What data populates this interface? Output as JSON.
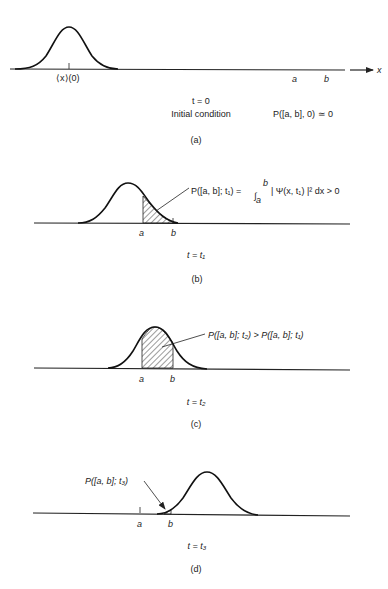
{
  "figure": {
    "panels": [
      {
        "id": "a",
        "caption": "(a)",
        "time_label": "t = 0",
        "subtitle": "Initial condition",
        "mean_label": "⟨x⟩(0)",
        "a_label": "a",
        "b_label": "b",
        "axis_label": "x",
        "probability_label": "P([a, b], 0) ≃ 0"
      },
      {
        "id": "b",
        "caption": "(b)",
        "time_label": "t = t₁",
        "a_label": "a",
        "b_label": "b",
        "probability_label": "P([a, b]; t₁) = ∫ₐᵇ |Ψ(x, t₁)|² dx > 0",
        "prob_lhs": "P([a, b]; t₁) =",
        "integral_sign": "∫",
        "int_upper": "b",
        "int_lower": "a",
        "integrand": "| Ψ(x, t₁) |² dx > 0"
      },
      {
        "id": "c",
        "caption": "(c)",
        "time_label": "t = t₂",
        "a_label": "a",
        "b_label": "b",
        "probability_label": "P([a, b]; t₂) > P([a, b]; t₁)"
      },
      {
        "id": "d",
        "caption": "(d)",
        "time_label": "t = t₃",
        "a_label": "a",
        "b_label": "b",
        "probability_label": "P([a, b]; t₃)"
      }
    ],
    "colors": {
      "ink": "#222222",
      "background": "#ffffff"
    }
  }
}
